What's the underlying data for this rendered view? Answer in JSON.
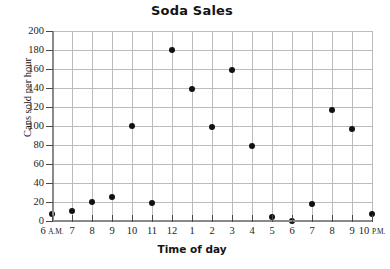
{
  "chart_data": {
    "type": "scatter",
    "title": "Soda Sales",
    "xlabel": "Time of day",
    "ylabel": "Cans sold per hour",
    "xlim": [
      6,
      22
    ],
    "ylim": [
      0,
      200
    ],
    "ytick_step": 20,
    "xtick_step": 1,
    "grid": true,
    "legend": "none",
    "yticks": [
      0,
      20,
      40,
      60,
      80,
      100,
      120,
      140,
      160,
      180,
      200
    ],
    "ytick_labels": [
      "0",
      "20",
      "40",
      "60",
      "80",
      "100",
      "120",
      "140",
      "160",
      "180",
      "200"
    ],
    "xticks": [
      6,
      7,
      8,
      9,
      10,
      11,
      12,
      13,
      14,
      15,
      16,
      17,
      18,
      19,
      20,
      21,
      22
    ],
    "xtick_labels": [
      {
        "num": "6",
        "ampm": "A.M."
      },
      {
        "num": "7",
        "ampm": ""
      },
      {
        "num": "8",
        "ampm": ""
      },
      {
        "num": "9",
        "ampm": ""
      },
      {
        "num": "10",
        "ampm": ""
      },
      {
        "num": "11",
        "ampm": ""
      },
      {
        "num": "12",
        "ampm": ""
      },
      {
        "num": "1",
        "ampm": ""
      },
      {
        "num": "2",
        "ampm": ""
      },
      {
        "num": "3",
        "ampm": ""
      },
      {
        "num": "4",
        "ampm": ""
      },
      {
        "num": "5",
        "ampm": ""
      },
      {
        "num": "6",
        "ampm": ""
      },
      {
        "num": "7",
        "ampm": ""
      },
      {
        "num": "8",
        "ampm": ""
      },
      {
        "num": "9",
        "ampm": ""
      },
      {
        "num": "10",
        "ampm": "P.M."
      }
    ],
    "x": [
      6,
      7,
      8,
      9,
      10,
      11,
      12,
      13,
      14,
      15,
      16,
      17,
      18,
      19,
      20,
      21,
      22
    ],
    "values": [
      7,
      11,
      20,
      25,
      100,
      19,
      180,
      139,
      99,
      159,
      79,
      4,
      0,
      18,
      117,
      97,
      7
    ],
    "points": [
      {
        "x": 6,
        "time": "6 A.M.",
        "y": 7
      },
      {
        "x": 7,
        "time": "7 A.M.",
        "y": 11
      },
      {
        "x": 8,
        "time": "8 A.M.",
        "y": 20
      },
      {
        "x": 9,
        "time": "9 A.M.",
        "y": 25
      },
      {
        "x": 10,
        "time": "10 A.M.",
        "y": 100
      },
      {
        "x": 11,
        "time": "11 A.M.",
        "y": 19
      },
      {
        "x": 12,
        "time": "12 P.M.",
        "y": 180
      },
      {
        "x": 13,
        "time": "1 P.M.",
        "y": 139
      },
      {
        "x": 14,
        "time": "2 P.M.",
        "y": 99
      },
      {
        "x": 15,
        "time": "3 P.M.",
        "y": 159
      },
      {
        "x": 16,
        "time": "4 P.M.",
        "y": 79
      },
      {
        "x": 17,
        "time": "5 P.M.",
        "y": 4
      },
      {
        "x": 18,
        "time": "6 P.M.",
        "y": 0
      },
      {
        "x": 19,
        "time": "7 P.M.",
        "y": 18
      },
      {
        "x": 20,
        "time": "8 P.M.",
        "y": 117
      },
      {
        "x": 21,
        "time": "9 P.M.",
        "y": 97
      },
      {
        "x": 22,
        "time": "10 P.M.",
        "y": 7
      }
    ],
    "colors": {
      "point": "#111111",
      "grid": "#bcbcbc",
      "axis": "#8a8a8a",
      "text": "#141414",
      "background": "#ffffff"
    }
  }
}
